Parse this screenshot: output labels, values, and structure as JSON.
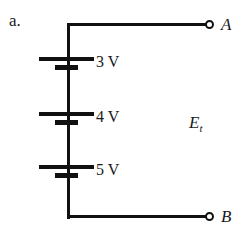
{
  "figure": {
    "part_label": "a.",
    "background_color": "#ffffff",
    "ink_color": "#111111",
    "width": 245,
    "height": 234
  },
  "circuit": {
    "type": "series-battery-string",
    "total_emf_symbol": "E",
    "total_emf_subscript": "t",
    "cells": [
      {
        "label": "3 V",
        "volts": 3,
        "order": 1
      },
      {
        "label": "4 V",
        "volts": 4,
        "order": 2
      },
      {
        "label": "5 V",
        "volts": 5,
        "order": 3
      }
    ],
    "terminals": [
      {
        "name": "A",
        "label": "A",
        "position": "top-right"
      },
      {
        "name": "B",
        "label": "B",
        "position": "bottom-right"
      }
    ]
  }
}
